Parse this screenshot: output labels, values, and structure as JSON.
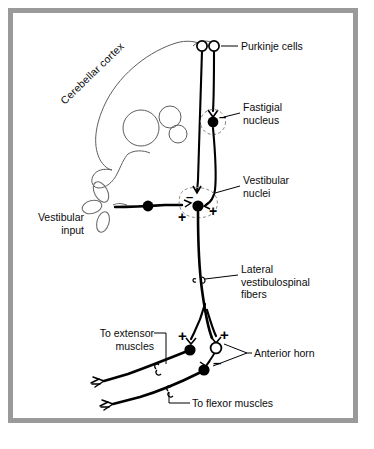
{
  "figure": {
    "frame_color": "#9a9a9a",
    "background_color": "#ffffff",
    "ink_color": "#000000",
    "light_ink_color": "#6e6e6e"
  },
  "labels": {
    "cerebellar_cortex": "Cerebellar cortex",
    "purkinje_cells": "Purkinje cells",
    "fastigial_nucleus": "Fastigial\nnucleus",
    "vestibular_nuclei": "Vestibular\nnuclei",
    "lateral_vestibulospinal_fibers": "Lateral\nvestibulospinal\nfibers",
    "vestibular_input": "Vestibular\ninput",
    "to_extensor_muscles": "To extensor\nmuscles",
    "anterior_horn": "Anterior horn",
    "to_flexor_muscles": "To flexor muscles"
  },
  "signs": {
    "fastigial_minus": "–",
    "vestibular_nuclei_minus": "–",
    "vestibular_nuclei_plus_left": "+",
    "vestibular_nuclei_plus_right": "+",
    "anterior_horn_plus_left": "+",
    "anterior_horn_plus_right": "+",
    "anterior_horn_minus": "–"
  },
  "elements": {
    "purkinje_cell_left": "open-circle-soma",
    "purkinje_cell_right": "open-circle-soma",
    "fastigial_soma": "filled-circle-soma",
    "vestibular_ganglion_soma": "filled-circle-soma",
    "vestibular_nuclei_soma": "filled-circle-soma",
    "extensor_motor_neuron": "filled-circle-soma",
    "inhibitory_interneuron": "open-circle-soma",
    "flexor_motor_neuron": "filled-circle-soma",
    "semicircular_canals": "vestibular-labyrinth"
  }
}
